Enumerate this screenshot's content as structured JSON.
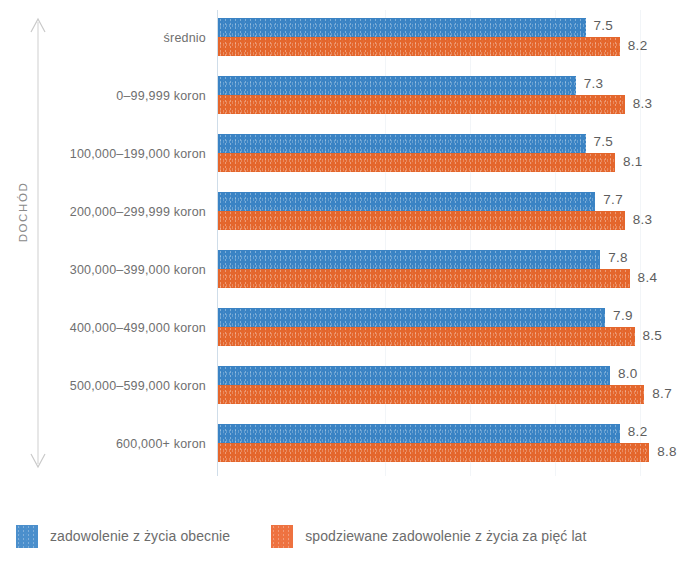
{
  "chart_data": {
    "type": "bar",
    "orientation": "horizontal",
    "title": "",
    "xlabel": "",
    "ylabel": "DOCHÓD",
    "grid": true,
    "grid_axis": "x",
    "legend_position": "bottom-left",
    "xlim": [
      0,
      10
    ],
    "categories": [
      "średnio",
      "0–99,999 koron",
      "100,000–199,000 koron",
      "200,000–299,999 koron",
      "300,000–399,000 koron",
      "400,000–499,000 koron",
      "500,000–599,000 koron",
      "600,000+ koron"
    ],
    "series": [
      {
        "name": "zadowolenie z życia obecnie",
        "color": "#3a83c4",
        "values": [
          7.5,
          7.3,
          7.5,
          7.7,
          7.8,
          7.9,
          8.0,
          8.2
        ],
        "labels": [
          "7.5",
          "7.3",
          "7.5",
          "7.7",
          "7.8",
          "7.9",
          "8.0",
          "8.2"
        ]
      },
      {
        "name": "spodziewane zadowolenie z życia za pięć lat",
        "color": "#e4662c",
        "values": [
          8.2,
          8.3,
          8.1,
          8.3,
          8.4,
          8.5,
          8.7,
          8.8
        ],
        "labels": [
          "8.2",
          "8.3",
          "8.1",
          "8.3",
          "8.4",
          "8.5",
          "8.7",
          "8.8"
        ]
      }
    ]
  },
  "axis": {
    "y_axis_label": "DOCHÓD",
    "arrow_icon": "double-arrow-vertical-icon"
  },
  "legend": {
    "items": [
      {
        "label": "zadowolenie z życia obecnie",
        "color": "#3a83c4",
        "swatch": "legend-swatch-blue"
      },
      {
        "label": "spodziewane zadowolenie z życia za pięć lat",
        "color": "#e4662c",
        "swatch": "legend-swatch-orange"
      }
    ]
  },
  "colors": {
    "series_current": "#3a83c4",
    "series_expected": "#e4662c",
    "axis_line": "#cfdde9",
    "gridline": "#f2f5f8",
    "text": "#6a6a6a"
  }
}
